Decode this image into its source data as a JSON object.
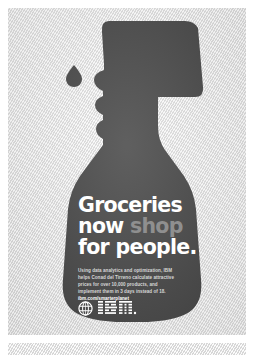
{
  "ad": {
    "brand": "IBM",
    "campaign": "Smarter Planet",
    "background_color": "#e4e4e4",
    "silhouette_color": "#0a0a0a",
    "headline": {
      "line1": "Groceries",
      "line2_plain": "now ",
      "line2_accent": "shop",
      "line3": "for people.",
      "accent_color": "#8f8f8f",
      "text_color": "#ffffff"
    },
    "body_copy": {
      "line1": "Using data analytics and optimization, IBM",
      "line2": "helps Conad del Tirreno calculate attractive",
      "line3": "prices for over 10,000 products, and",
      "line4": "implement them in 3 days instead of 18.",
      "url": "ibm.com/smarterplanet",
      "text_color": "#d7d7d7"
    },
    "logo": {
      "wordmark": "IBM",
      "icon_name": "smarter-planet-globe-icon",
      "trademark": "®"
    },
    "imagery": {
      "object": "spray-bottle-face-profile-silhouette",
      "droplet": "water-drop"
    }
  }
}
